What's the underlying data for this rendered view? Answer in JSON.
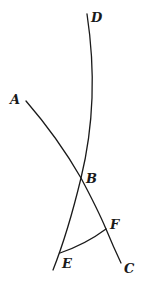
{
  "diagram": {
    "type": "geometry",
    "background": "#ffffff",
    "stroke_color": "#1a1a1a",
    "points": {
      "A": {
        "label": "A",
        "x": 26,
        "y": 101
      },
      "B": {
        "label": "B",
        "x": 81,
        "y": 178
      },
      "C": {
        "label": "C",
        "x": 121,
        "y": 263
      },
      "D": {
        "label": "D",
        "x": 87,
        "y": 14
      },
      "E": {
        "label": "E",
        "x": 60,
        "y": 253
      },
      "F": {
        "label": "F",
        "x": 106,
        "y": 229
      }
    },
    "curves": [
      {
        "name": "arc-D-through-B-to-E",
        "description": "Long arc from D down through B and E"
      },
      {
        "name": "line-A-B-F-C",
        "description": "Slightly curved line from A through B and F to C"
      },
      {
        "name": "arc-E-F",
        "description": "Short arc connecting E and F"
      }
    ],
    "labels": [
      "A",
      "B",
      "C",
      "D",
      "E",
      "F"
    ]
  }
}
